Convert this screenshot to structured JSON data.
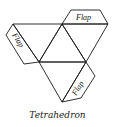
{
  "diagram": {
    "caption": "Tetrahedron",
    "flaps": [
      {
        "label": "Flap",
        "position": "top"
      },
      {
        "label": "Flap",
        "position": "left"
      },
      {
        "label": "Flap",
        "position": "bottom-right"
      }
    ],
    "faces": 4,
    "line_color": "#1a1a1a"
  }
}
